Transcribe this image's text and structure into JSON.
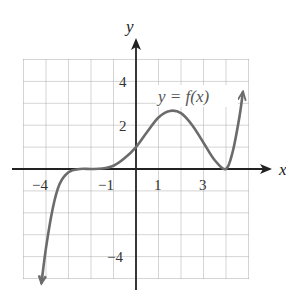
{
  "chart_data": {
    "type": "line",
    "title": "",
    "xlabel": "x",
    "ylabel": "y",
    "curve_label": "y = f(x)",
    "xlim": [
      -5,
      5
    ],
    "ylim": [
      -5,
      5
    ],
    "grid": true,
    "x_ticks": [
      {
        "value": -4,
        "label": "−4"
      },
      {
        "value": -1,
        "label": "−1"
      },
      {
        "value": 1,
        "label": "1"
      },
      {
        "value": 3,
        "label": "3"
      }
    ],
    "y_ticks": [
      {
        "value": 4,
        "label": "4"
      },
      {
        "value": 2,
        "label": "2"
      },
      {
        "value": -4,
        "label": "−4"
      }
    ],
    "series": [
      {
        "name": "f(x)",
        "color": "#6b6b6b",
        "points": [
          [
            -4.2,
            -5.2
          ],
          [
            -4.0,
            -3.6
          ],
          [
            -3.7,
            -1.8
          ],
          [
            -3.4,
            -0.7
          ],
          [
            -3.0,
            -0.15
          ],
          [
            -2.5,
            0.0
          ],
          [
            -2.0,
            0.0
          ],
          [
            -1.5,
            0.02
          ],
          [
            -1.0,
            0.15
          ],
          [
            -0.5,
            0.5
          ],
          [
            0.0,
            1.0
          ],
          [
            0.5,
            1.7
          ],
          [
            1.0,
            2.35
          ],
          [
            1.5,
            2.65
          ],
          [
            2.0,
            2.55
          ],
          [
            2.5,
            2.0
          ],
          [
            3.0,
            1.2
          ],
          [
            3.5,
            0.4
          ],
          [
            4.0,
            0.0
          ],
          [
            4.3,
            0.8
          ],
          [
            4.6,
            2.4
          ],
          [
            4.75,
            3.5
          ]
        ],
        "arrow_ends": true
      }
    ]
  },
  "labels": {
    "x_axis": "x",
    "y_axis": "y",
    "equation": "y = f(x)",
    "xt_m4": "−4",
    "xt_m1": "−1",
    "xt_1": "1",
    "xt_3": "3",
    "yt_4": "4",
    "yt_2": "2",
    "yt_m4": "−4"
  }
}
